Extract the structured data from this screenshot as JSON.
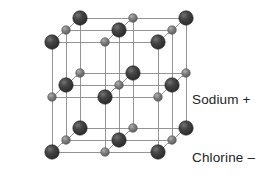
{
  "figure": {
    "background_color": "#ffffff",
    "width": 273,
    "height": 177
  },
  "lattice": {
    "structure_name": "rock-salt-cubic-lattice",
    "cells_x": 2,
    "cells_y": 2,
    "cells_z": 2,
    "nodes_x": 3,
    "nodes_y": 3,
    "nodes_z": 3,
    "origin_x": 52,
    "origin_y": 152,
    "step_x": 53,
    "step_y": -55,
    "depth_dx": 14,
    "depth_dy": -12,
    "bond_color": "#8a8a8a",
    "bond_width": 0.9
  },
  "ions": {
    "chlorine": {
      "name": "Chlorine",
      "sign": "–",
      "label": "Chlorine –",
      "color": "#3a3a3a",
      "highlight_color": "#6e6e6e",
      "edge_color": "#1d1d1d",
      "radius": 7.2
    },
    "sodium": {
      "name": "Sodium",
      "sign": "+",
      "label": "Sodium +",
      "color": "#7a7a7a",
      "highlight_color": "#a8a8a8",
      "edge_color": "#555555",
      "radius": 4.3
    }
  },
  "legend": {
    "items": [
      {
        "key": "sodium",
        "label": "Sodium +"
      },
      {
        "key": "chlorine",
        "label": "Chlorine –"
      }
    ],
    "sodium_label": "Sodium +",
    "chlorine_label": "Chlorine –"
  }
}
